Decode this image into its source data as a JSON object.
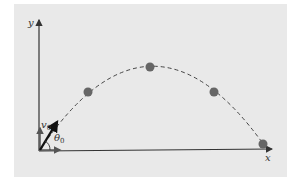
{
  "diagram": {
    "type": "projectile-motion",
    "axes": {
      "x_label": "x",
      "y_label": "y"
    },
    "initial_velocity": {
      "symbol": "v",
      "subscript": "0"
    },
    "launch_angle": {
      "symbol": "θ",
      "subscript": "0"
    },
    "trajectory": {
      "style": "dashed parabola",
      "ball_count": 4,
      "balls": [
        {
          "x": 88,
          "y": 92
        },
        {
          "x": 150,
          "y": 67
        },
        {
          "x": 214,
          "y": 92
        },
        {
          "x": 263,
          "y": 144
        }
      ]
    },
    "colors": {
      "panel": "#e9e9e9",
      "axis": "#333333",
      "ball": "#666666",
      "trajectory": "#444444",
      "vector": "#111111"
    }
  }
}
